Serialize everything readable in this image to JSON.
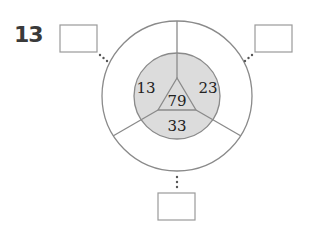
{
  "problem": {
    "number": "13"
  },
  "diagram": {
    "colors": {
      "line": "#8a8a8a",
      "inner_fill": "#dcdcdc",
      "text": "#222222",
      "box_border": "#9a9a9a",
      "dots": "#555555"
    },
    "center_value": "79",
    "inner_regions": [
      {
        "position": "left",
        "value": "13"
      },
      {
        "position": "right",
        "value": "23"
      },
      {
        "position": "bottom",
        "value": "33"
      }
    ],
    "answer_boxes": [
      {
        "position": "top-left",
        "value": ""
      },
      {
        "position": "top-right",
        "value": ""
      },
      {
        "position": "bottom",
        "value": ""
      }
    ]
  }
}
